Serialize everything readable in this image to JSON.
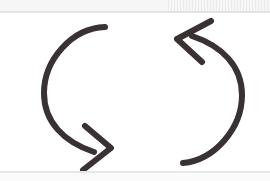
{
  "image": {
    "title": "Recycle arrows symbol",
    "description": "Two semicircular arrows forming a cyclical refresh / sync loop",
    "width": 270,
    "height": 181,
    "background_color": "#ffffff"
  },
  "palette": {
    "stroke": "#3a3133",
    "background": "#ffffff",
    "scan_band": "#f6f6f7",
    "scan_rule": "#e3e4e6",
    "speckle": "#c8c8cd"
  },
  "glyph": {
    "name": "recycle-arrows",
    "stroke_width": 6,
    "stroke_linecap": "round",
    "stroke_linejoin": "round",
    "left_arrow": {
      "name": "left-arc-arrow",
      "direction": "counterclockwise-descending",
      "arrowhead": "chevron-down-right",
      "arc_path": "M 105 27 C 72 28 44 60 44 93 C 44 122 64 142 94 152",
      "head_path": "M 85 126 L 111 148 L 83 170",
      "tip": {
        "x": 111,
        "y": 148
      }
    },
    "right_arrow": {
      "name": "right-arc-arrow",
      "direction": "clockwise-ascending",
      "arrowhead": "chevron-up-left",
      "arc_path": "M 183 163 C 215 160 242 128 242 95 C 242 66 222 46 192 36",
      "head_path": "M 211 21 L 177 39 L 202 62",
      "tip": {
        "x": 177,
        "y": 39
      }
    }
  },
  "decorations": {
    "top_band_label": "scan-band-top",
    "top_rule_label": "scan-rule-top",
    "bottom_rule_label": "scan-rule-bottom",
    "bottom_band_label": "scan-band-bottom",
    "speckle_label": "paper-speckle"
  }
}
